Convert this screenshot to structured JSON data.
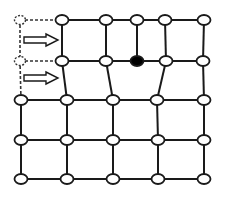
{
  "diagram": {
    "colors": {
      "edge": "#1a1a1a",
      "node_fill": "#ffffff",
      "node_filled": "#000000",
      "dashed": "#333333"
    },
    "nodes": [
      {
        "id": "r0c1",
        "x": 62,
        "y": 20,
        "type": "open"
      },
      {
        "id": "r0c2",
        "x": 106,
        "y": 20,
        "type": "open"
      },
      {
        "id": "r0c3",
        "x": 137,
        "y": 20,
        "type": "open"
      },
      {
        "id": "r0c4",
        "x": 165,
        "y": 20,
        "type": "open"
      },
      {
        "id": "r0c5",
        "x": 204,
        "y": 20,
        "type": "open"
      },
      {
        "id": "r1c1",
        "x": 62,
        "y": 61,
        "type": "open"
      },
      {
        "id": "r1c2",
        "x": 106,
        "y": 61,
        "type": "open"
      },
      {
        "id": "r1c3",
        "x": 137,
        "y": 61,
        "type": "filled"
      },
      {
        "id": "r1c4",
        "x": 166,
        "y": 61,
        "type": "open"
      },
      {
        "id": "r1c5",
        "x": 203,
        "y": 61,
        "type": "open"
      },
      {
        "id": "r2c0",
        "x": 21,
        "y": 100,
        "type": "open"
      },
      {
        "id": "r2c1",
        "x": 67,
        "y": 100,
        "type": "open"
      },
      {
        "id": "r2c2",
        "x": 113,
        "y": 100,
        "type": "open"
      },
      {
        "id": "r2c3",
        "x": 157,
        "y": 100,
        "type": "open"
      },
      {
        "id": "r2c4",
        "x": 204,
        "y": 100,
        "type": "open"
      },
      {
        "id": "r3c0",
        "x": 21,
        "y": 140,
        "type": "open"
      },
      {
        "id": "r3c1",
        "x": 67,
        "y": 140,
        "type": "open"
      },
      {
        "id": "r3c2",
        "x": 113,
        "y": 140,
        "type": "open"
      },
      {
        "id": "r3c3",
        "x": 158,
        "y": 140,
        "type": "open"
      },
      {
        "id": "r3c4",
        "x": 204,
        "y": 140,
        "type": "open"
      },
      {
        "id": "r4c0",
        "x": 21,
        "y": 179,
        "type": "open"
      },
      {
        "id": "r4c1",
        "x": 67,
        "y": 179,
        "type": "open"
      },
      {
        "id": "r4c2",
        "x": 113,
        "y": 179,
        "type": "open"
      },
      {
        "id": "r4c3",
        "x": 158,
        "y": 179,
        "type": "open"
      },
      {
        "id": "r4c4",
        "x": 204,
        "y": 179,
        "type": "open"
      }
    ],
    "ghost_nodes": [
      {
        "id": "g0",
        "x": 20,
        "y": 20
      },
      {
        "id": "g1",
        "x": 20,
        "y": 61
      }
    ],
    "edges": [
      [
        "r0c1",
        "r0c2"
      ],
      [
        "r0c2",
        "r0c3"
      ],
      [
        "r0c3",
        "r0c4"
      ],
      [
        "r0c4",
        "r0c5"
      ],
      [
        "r1c1",
        "r1c2"
      ],
      [
        "r1c2",
        "r1c3"
      ],
      [
        "r1c3",
        "r1c4"
      ],
      [
        "r1c4",
        "r1c5"
      ],
      [
        "r0c1",
        "r1c1"
      ],
      [
        "r0c2",
        "r1c2"
      ],
      [
        "r0c3",
        "r1c3"
      ],
      [
        "r0c4",
        "r1c4"
      ],
      [
        "r0c5",
        "r1c5"
      ],
      [
        "r1c1",
        "r2c1"
      ],
      [
        "r1c2",
        "r2c2"
      ],
      [
        "r1c4",
        "r2c3"
      ],
      [
        "r1c5",
        "r2c4"
      ],
      [
        "r2c0",
        "r2c1"
      ],
      [
        "r2c1",
        "r2c2"
      ],
      [
        "r2c2",
        "r2c3"
      ],
      [
        "r2c3",
        "r2c4"
      ],
      [
        "r3c0",
        "r3c1"
      ],
      [
        "r3c1",
        "r3c2"
      ],
      [
        "r3c2",
        "r3c3"
      ],
      [
        "r3c3",
        "r3c4"
      ],
      [
        "r4c0",
        "r4c1"
      ],
      [
        "r4c1",
        "r4c2"
      ],
      [
        "r4c2",
        "r4c3"
      ],
      [
        "r4c3",
        "r4c4"
      ],
      [
        "r2c0",
        "r3c0"
      ],
      [
        "r2c1",
        "r3c1"
      ],
      [
        "r2c2",
        "r3c2"
      ],
      [
        "r2c3",
        "r3c3"
      ],
      [
        "r2c4",
        "r3c4"
      ],
      [
        "r3c0",
        "r4c0"
      ],
      [
        "r3c1",
        "r4c1"
      ],
      [
        "r3c2",
        "r4c2"
      ],
      [
        "r3c3",
        "r4c3"
      ],
      [
        "r3c4",
        "r4c4"
      ]
    ],
    "dashed_edges": [
      [
        "g0",
        "r0c1"
      ],
      [
        "g1",
        "r1c1"
      ],
      [
        "g0",
        "g1"
      ],
      [
        "g1",
        "r2c0"
      ]
    ],
    "arrows": [
      {
        "id": "arrow-top",
        "x1": 24,
        "x2": 58,
        "y": 40
      },
      {
        "id": "arrow-bottom",
        "x1": 24,
        "x2": 58,
        "y": 78
      }
    ]
  }
}
